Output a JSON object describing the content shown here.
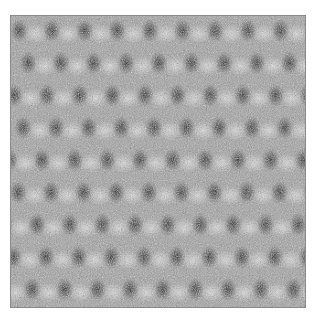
{
  "image": {
    "description": "Noisy grayscale micrograph showing a periodic lattice of dark spots",
    "lattice": {
      "rows": 9,
      "cols": 9,
      "spot_color": "#1e1e1e",
      "background_color": "#9a9a9a",
      "highlight_color": "#e6e6e6"
    }
  }
}
